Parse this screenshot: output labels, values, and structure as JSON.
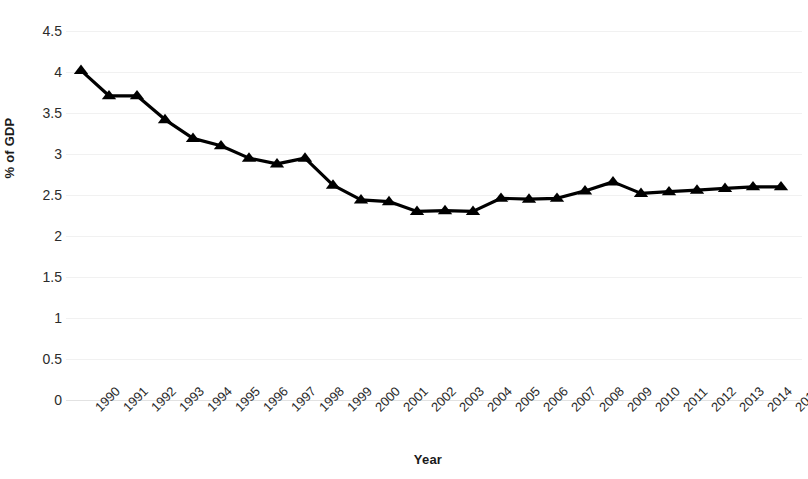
{
  "chart_data": {
    "type": "line",
    "title": "",
    "subtitle": "",
    "xlabel": "Year",
    "ylabel": "% of GDP",
    "categories": [
      "1990",
      "1991",
      "1992",
      "1993",
      "1994",
      "1995",
      "1996",
      "1997",
      "1998",
      "1999",
      "2000",
      "2001",
      "2002",
      "2003",
      "2004",
      "2005",
      "2006",
      "2007",
      "2008",
      "2009",
      "2010",
      "2011",
      "2012",
      "2013",
      "2014",
      "2015"
    ],
    "values": [
      4.02,
      3.71,
      3.71,
      3.42,
      3.19,
      3.1,
      2.95,
      2.88,
      2.95,
      2.62,
      2.44,
      2.42,
      2.3,
      2.31,
      2.3,
      2.46,
      2.45,
      2.46,
      2.55,
      2.66,
      2.52,
      2.54,
      2.56,
      2.58,
      2.6,
      2.6
    ],
    "series": [
      {
        "name": "% of GDP",
        "values": [
          4.02,
          3.71,
          3.71,
          3.42,
          3.19,
          3.1,
          2.95,
          2.88,
          2.95,
          2.62,
          2.44,
          2.42,
          2.3,
          2.31,
          2.3,
          2.46,
          2.45,
          2.46,
          2.55,
          2.66,
          2.52,
          2.54,
          2.56,
          2.58,
          2.6,
          2.6
        ],
        "color": "#000000",
        "marker": "triangle-up"
      }
    ],
    "ylim": [
      0,
      4.5
    ],
    "yticks": [
      0,
      0.5,
      1,
      1.5,
      2,
      2.5,
      3,
      3.5,
      4,
      4.5
    ],
    "ytick_labels": [
      "0",
      "0.5",
      "1",
      "1.5",
      "2",
      "2.5",
      "3",
      "3.5",
      "4",
      "4.5"
    ],
    "grid": true,
    "grid_axis": "y",
    "legend": false,
    "legend_position": "none",
    "annotations": [],
    "xtick_rotation": -45,
    "line_color": "#000000",
    "grid_color": "#f1f1f1",
    "background_color": "#ffffff"
  }
}
